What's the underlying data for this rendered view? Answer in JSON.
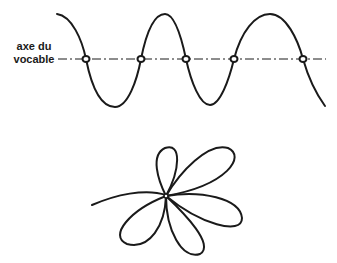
{
  "diagram": {
    "axis_label_line1": "axe du",
    "axis_label_line2": "vocable",
    "stroke_color": "#1a1a1a",
    "background": "#ffffff",
    "top_figure": {
      "type": "sinusoidal wave crossing a dash-dot axis",
      "crossing_points": 5
    },
    "bottom_figure": {
      "type": "flower of loops around a central node",
      "petals": 5
    }
  }
}
